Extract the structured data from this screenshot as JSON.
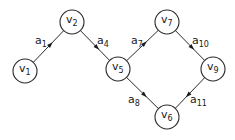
{
  "diagram": {
    "type": "directed-graph",
    "nodes": [
      {
        "id": "v1",
        "label": "v",
        "sub": "1",
        "x": 25,
        "y": 71
      },
      {
        "id": "v2",
        "label": "v",
        "sub": "2",
        "x": 72,
        "y": 22
      },
      {
        "id": "v5",
        "label": "v",
        "sub": "5",
        "x": 118,
        "y": 69
      },
      {
        "id": "v7",
        "label": "v",
        "sub": "7",
        "x": 167,
        "y": 22
      },
      {
        "id": "v9",
        "label": "v",
        "sub": "9",
        "x": 213,
        "y": 69
      },
      {
        "id": "v6",
        "label": "v",
        "sub": "6",
        "x": 167,
        "y": 117
      }
    ],
    "edges": [
      {
        "id": "a1",
        "label": "a",
        "sub": "1",
        "from": "v1",
        "to": "v2",
        "lx": 35,
        "ly": 44
      },
      {
        "id": "a4",
        "label": "a",
        "sub": "4",
        "from": "v2",
        "to": "v5",
        "lx": 97,
        "ly": 44
      },
      {
        "id": "a7",
        "label": "a",
        "sub": "7",
        "from": "v5",
        "to": "v7",
        "lx": 131,
        "ly": 44
      },
      {
        "id": "a10",
        "label": "a",
        "sub": "10",
        "from": "v7",
        "to": "v9",
        "lx": 192,
        "ly": 44
      },
      {
        "id": "a8",
        "label": "a",
        "sub": "8",
        "from": "v5",
        "to": "v6",
        "lx": 128,
        "ly": 103
      },
      {
        "id": "a11",
        "label": "a",
        "sub": "11",
        "from": "v9",
        "to": "v6",
        "lx": 190,
        "ly": 103
      }
    ]
  }
}
